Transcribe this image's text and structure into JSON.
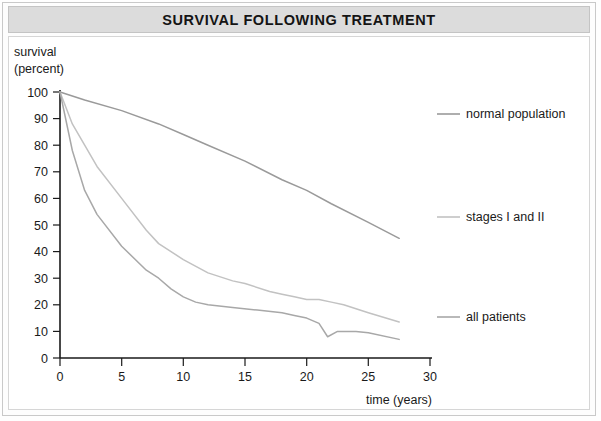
{
  "figure": {
    "title": "SURVIVAL FOLLOWING TREATMENT",
    "title_band_color": "#dcdcdc",
    "frame_color": "#c9c9c9",
    "background_color": "#ffffff"
  },
  "axes": {
    "ylabel_line1": "survival",
    "ylabel_line2": "(percent)",
    "xlabel": "time (years)",
    "yticks": [
      "0",
      "10",
      "20",
      "30",
      "40",
      "50",
      "60",
      "70",
      "80",
      "90",
      "100"
    ],
    "xticks": [
      "0",
      "5",
      "10",
      "15",
      "20",
      "25",
      "30"
    ],
    "axis_color": "#1a1a1a"
  },
  "legend": {
    "items": [
      {
        "label": "normal population",
        "color": "#9a9a9a"
      },
      {
        "label": "stages I and II",
        "color": "#c2c2c2"
      },
      {
        "label": "all patients",
        "color": "#a8a8a8"
      }
    ]
  },
  "chart_data": {
    "type": "line",
    "title": "SURVIVAL FOLLOWING TREATMENT",
    "xlabel": "time (years)",
    "ylabel": "survival (percent)",
    "xlim": [
      0,
      30
    ],
    "ylim": [
      0,
      100
    ],
    "xticks": [
      0,
      5,
      10,
      15,
      20,
      25,
      30
    ],
    "yticks": [
      0,
      10,
      20,
      30,
      40,
      50,
      60,
      70,
      80,
      90,
      100
    ],
    "grid": false,
    "legend_position": "right",
    "series": [
      {
        "name": "normal population",
        "color": "#9a9a9a",
        "x": [
          0,
          2,
          5,
          8,
          10,
          12,
          15,
          18,
          20,
          22,
          25,
          27.5
        ],
        "y": [
          100,
          97,
          93,
          88,
          84,
          80,
          74,
          67,
          63,
          58,
          51,
          45
        ]
      },
      {
        "name": "stages I and II",
        "color": "#c2c2c2",
        "x": [
          0,
          1,
          2,
          3,
          5,
          7,
          8,
          10,
          12,
          14,
          15,
          17,
          18,
          19,
          20,
          21,
          22,
          23,
          25,
          27.5
        ],
        "y": [
          100,
          88,
          80,
          72,
          60,
          48,
          43,
          37,
          32,
          29,
          28,
          25,
          24,
          23,
          22,
          22,
          21,
          20,
          17,
          13.5
        ]
      },
      {
        "name": "all patients",
        "color": "#a8a8a8",
        "x": [
          0,
          1,
          2,
          3,
          5,
          7,
          8,
          9,
          10,
          11,
          12,
          14,
          16,
          18,
          19,
          20,
          21,
          21.7,
          22.5,
          24,
          25,
          27.5
        ],
        "y": [
          100,
          78,
          63,
          54,
          42,
          33,
          30,
          26,
          23,
          21,
          20,
          19,
          18,
          17,
          16,
          15,
          13,
          8,
          10,
          10,
          9.5,
          7
        ]
      }
    ]
  }
}
